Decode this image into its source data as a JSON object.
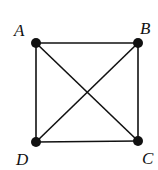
{
  "diagram": {
    "type": "complete-graph-K4",
    "vertices": [
      {
        "id": "A",
        "label": "A",
        "x": 36,
        "y": 43,
        "label_x": 14,
        "label_y": 22
      },
      {
        "id": "B",
        "label": "B",
        "x": 138,
        "y": 43,
        "label_x": 140,
        "label_y": 20
      },
      {
        "id": "C",
        "label": "C",
        "x": 138,
        "y": 141,
        "label_x": 142,
        "label_y": 150
      },
      {
        "id": "D",
        "label": "D",
        "x": 36,
        "y": 142,
        "label_x": 16,
        "label_y": 151
      }
    ],
    "edges": [
      [
        "A",
        "B"
      ],
      [
        "B",
        "C"
      ],
      [
        "C",
        "D"
      ],
      [
        "D",
        "A"
      ],
      [
        "A",
        "C"
      ],
      [
        "B",
        "D"
      ]
    ],
    "colors": {
      "line": "#111111",
      "vertex": "#111111",
      "background": "#ffffff"
    }
  }
}
